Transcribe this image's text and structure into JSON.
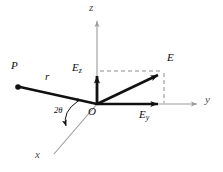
{
  "figure": {
    "type": "physics-vector-diagram",
    "width": 223,
    "height": 172,
    "background_color": "#ffffff"
  },
  "axes": [
    {
      "name": "z",
      "label": "z",
      "color": "#9a9a9a",
      "direction": "up",
      "from": [
        97,
        104
      ],
      "to": [
        97,
        18
      ],
      "label_pos": [
        91,
        4
      ]
    },
    {
      "name": "y",
      "label": "y",
      "color": "#9a9a9a",
      "direction": "right",
      "from": [
        97,
        104
      ],
      "to": [
        201,
        104
      ],
      "label_pos": [
        205,
        96
      ]
    },
    {
      "name": "x",
      "label": "x",
      "color": "#9a9a9a",
      "direction": "lower-left",
      "from": [
        97,
        104
      ],
      "to": [
        52,
        156
      ],
      "label_pos": [
        36,
        150
      ]
    }
  ],
  "vectors": [
    {
      "name": "E",
      "label": "E",
      "color": "#111111",
      "from": [
        97,
        104
      ],
      "to": [
        164,
        72
      ],
      "label_pos": [
        169,
        55
      ],
      "style": "solid-arrow-thick"
    },
    {
      "name": "Ez",
      "label": "E",
      "subscript": "z",
      "color": "#111111",
      "from": [
        97,
        104
      ],
      "to": [
        97,
        70
      ],
      "label_pos": [
        74,
        64
      ],
      "style": "solid-arrow-thick"
    },
    {
      "name": "Ey",
      "label": "E",
      "subscript": "y",
      "color": "#111111",
      "from": [
        97,
        104
      ],
      "to": [
        164,
        104
      ],
      "label_pos": [
        140,
        110
      ],
      "style": "solid-arrow-thick"
    },
    {
      "name": "r",
      "label": "r",
      "color": "#111111",
      "from": [
        97,
        104
      ],
      "to": [
        18,
        87
      ],
      "label_pos": [
        48,
        74
      ],
      "style": "solid-line-thick-with-dot"
    }
  ],
  "points": [
    {
      "name": "P",
      "label": "P",
      "pos": [
        18,
        87
      ],
      "label_pos": [
        13,
        63
      ],
      "marker": "filled-dot"
    },
    {
      "name": "O",
      "label": "O",
      "pos": [
        97,
        104
      ],
      "label_pos": [
        90,
        108
      ],
      "marker": "origin"
    }
  ],
  "angle": {
    "name": "two-theta",
    "label": "2θ",
    "label_pos": [
      56,
      108
    ],
    "color": "#111111",
    "between": [
      "r",
      "x"
    ],
    "arc_from": [
      77,
      100
    ],
    "arc_to": [
      67,
      128
    ]
  },
  "construction_lines": [
    {
      "name": "dashed-horizontal-to-E",
      "style": "dashed",
      "color": "#8c8c8c",
      "from": [
        99,
        71
      ],
      "to": [
        164,
        71
      ]
    },
    {
      "name": "dashed-vertical-to-Ey",
      "style": "dashed",
      "color": "#8c8c8c",
      "from": [
        164,
        72
      ],
      "to": [
        164,
        103
      ]
    }
  ]
}
